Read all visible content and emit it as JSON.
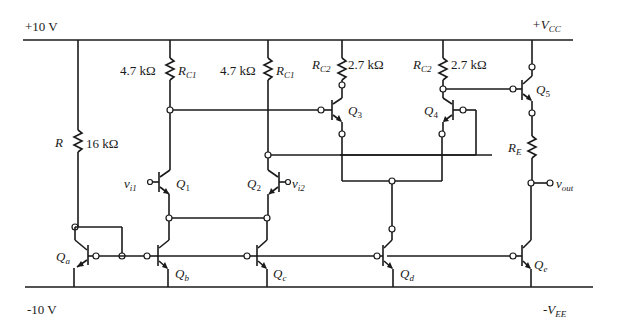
{
  "rails": {
    "top_left": "+10 V",
    "top_right_main": "+V",
    "top_right_sub": "CC",
    "bottom_left": "-10 V",
    "bottom_right_main": "-V",
    "bottom_right_sub": "EE"
  },
  "resistors": {
    "r": {
      "name": "R",
      "value": "16 kΩ"
    },
    "rc1_left": {
      "name": "R",
      "sub": "C1",
      "value": "4.7 kΩ"
    },
    "rc1_right": {
      "name": "R",
      "sub": "C1",
      "value": "4.7 kΩ"
    },
    "rc2_left": {
      "name": "R",
      "sub": "C2",
      "value": "2.7 kΩ"
    },
    "rc2_right": {
      "name": "R",
      "sub": "C2",
      "value": "2.7 kΩ"
    },
    "re": {
      "name": "R",
      "sub": "E"
    }
  },
  "transistors": {
    "q1": {
      "name": "Q",
      "sub": "1"
    },
    "q2": {
      "name": "Q",
      "sub": "2"
    },
    "q3": {
      "name": "Q",
      "sub": "3"
    },
    "q4": {
      "name": "Q",
      "sub": "4"
    },
    "q5": {
      "name": "Q",
      "sub": "5"
    },
    "qa": {
      "name": "Q",
      "sub": "a"
    },
    "qb": {
      "name": "Q",
      "sub": "b"
    },
    "qc": {
      "name": "Q",
      "sub": "c"
    },
    "qd": {
      "name": "Q",
      "sub": "d"
    },
    "qe": {
      "name": "Q",
      "sub": "e"
    }
  },
  "signals": {
    "vi1": {
      "name": "v",
      "sub": "i1"
    },
    "vi2": {
      "name": "v",
      "sub": "i2"
    },
    "vout": {
      "name": "v",
      "sub": "out"
    }
  }
}
